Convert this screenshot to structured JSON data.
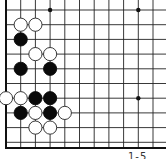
{
  "board": {
    "corner": "bottom-left",
    "cols": 11,
    "rows": 10,
    "origin_x": 6,
    "origin_y": 10,
    "spacing": 14.7,
    "line_color": "#222222",
    "edge_color": "#111111",
    "star_points": [
      [
        3,
        0
      ],
      [
        9,
        0
      ],
      [
        9,
        6
      ]
    ],
    "stones": [
      {
        "col": 1,
        "row": 1,
        "color": "white"
      },
      {
        "col": 2,
        "row": 1,
        "color": "white"
      },
      {
        "col": 1,
        "row": 2,
        "color": "black"
      },
      {
        "col": 2,
        "row": 3,
        "color": "white"
      },
      {
        "col": 3,
        "row": 3,
        "color": "white"
      },
      {
        "col": 1,
        "row": 4,
        "color": "black"
      },
      {
        "col": 3,
        "row": 4,
        "color": "black"
      },
      {
        "col": 0,
        "row": 6,
        "color": "white"
      },
      {
        "col": 1,
        "row": 6,
        "color": "white"
      },
      {
        "col": 2,
        "row": 6,
        "color": "black"
      },
      {
        "col": 3,
        "row": 6,
        "color": "black"
      },
      {
        "col": 1,
        "row": 7,
        "color": "black"
      },
      {
        "col": 2,
        "row": 7,
        "color": "white"
      },
      {
        "col": 3,
        "row": 7,
        "color": "black"
      },
      {
        "col": 4,
        "row": 7,
        "color": "white"
      },
      {
        "col": 2,
        "row": 8,
        "color": "white"
      },
      {
        "col": 3,
        "row": 8,
        "color": "white"
      }
    ]
  },
  "caption": "1-5"
}
